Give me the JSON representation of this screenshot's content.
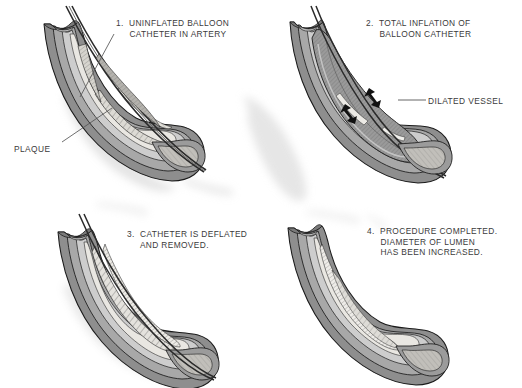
{
  "figure": {
    "background_color": "#ffffff",
    "text_color": "#3b3b3b",
    "ink_color": "#1a1a1a",
    "panel_count": 4
  },
  "palette": {
    "adventitia": "#8e8e8e",
    "media": "#a8a8a8",
    "intima": "#cdcdcd",
    "lumen": "#e9e7e2",
    "plaque": "#dcdad4",
    "balloon": "#9a9a9a",
    "catheter": "#6a6a6a",
    "shadow": "#d8d8d8",
    "outline": "#1a1a1a",
    "arrow": "#111111"
  },
  "panels": [
    {
      "id": "panel-1",
      "number": "1.",
      "caption_lines": [
        "UNINFLATED BALLOON",
        "CATHETER IN ARTERY"
      ],
      "caption_text": "1.  UNINFLATED BALLOON\n     CATHETER IN ARTERY",
      "callouts": [
        {
          "id": "callout-plaque",
          "label": "PLAQUE",
          "leader": {
            "from_x": 62,
            "from_y": 143,
            "to_x": 112,
            "to_y": 109
          }
        },
        {
          "id": "callout-caption-leader-1",
          "label": "",
          "leader": {
            "from_x": 114,
            "from_y": 34,
            "to_x": 79,
            "to_y": 96
          }
        }
      ]
    },
    {
      "id": "panel-2",
      "number": "2.",
      "caption_lines": [
        "TOTAL INFLATION OF",
        "BALLOON CATHETER"
      ],
      "caption_text": "2.  TOTAL INFLATION OF\n     BALLOON CATHETER",
      "callouts": [
        {
          "id": "callout-dilated-vessel",
          "label": "DILATED VESSEL",
          "leader": {
            "from_x": 398,
            "from_y": 100,
            "to_x": 426,
            "to_y": 100
          }
        }
      ],
      "annotations": [
        {
          "id": "expansion-arrow-upper",
          "type": "double-headed-arrow",
          "x": 357,
          "y": 97
        },
        {
          "id": "expansion-arrow-lower",
          "type": "double-headed-arrow",
          "x": 338,
          "y": 113
        }
      ]
    },
    {
      "id": "panel-3",
      "number": "3.",
      "caption_lines": [
        "CATHETER IS DEFLATED",
        "AND REMOVED."
      ],
      "caption_text": "3.  CATHETER IS DEFLATED\n     AND REMOVED.",
      "callouts": []
    },
    {
      "id": "panel-4",
      "number": "4.",
      "caption_lines": [
        "PROCEDURE COMPLETED.",
        "DIAMETER OF LUMEN",
        "HAS BEEN INCREASED."
      ],
      "caption_text": "4.  PROCEDURE COMPLETED.\n     DIAMETER OF LUMEN\n     HAS BEEN INCREASED.",
      "callouts": []
    }
  ]
}
